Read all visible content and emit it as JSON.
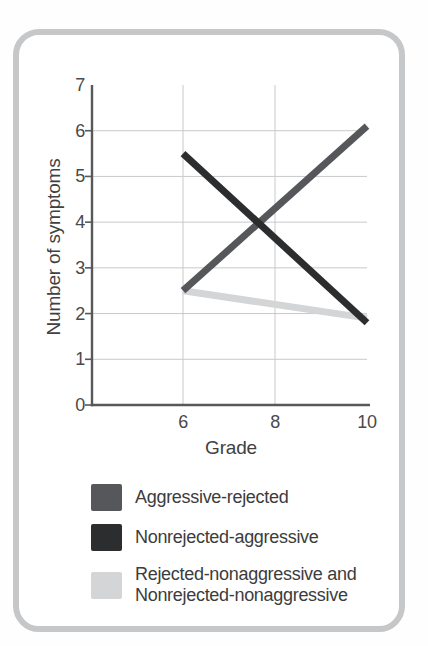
{
  "card": {
    "border_color": "#c6c7c8",
    "background": "#ffffff"
  },
  "chart_data": {
    "type": "line",
    "title": "",
    "xlabel": "Grade",
    "ylabel": "Number of symptoms",
    "xlim": [
      4,
      10
    ],
    "ylim": [
      0,
      7
    ],
    "xticks": [
      6,
      8,
      10
    ],
    "yticks": [
      0,
      1,
      2,
      3,
      4,
      5,
      6,
      7
    ],
    "grid": {
      "horizontal_at": [
        1,
        2,
        3,
        4,
        5,
        6
      ],
      "vertical_at": [
        6,
        8
      ]
    },
    "x": [
      6,
      10
    ],
    "series": [
      {
        "name": "Aggressive-rejected",
        "color": "#56575a",
        "values": [
          2.5,
          6.1
        ]
      },
      {
        "name": "Nonrejected-aggressive",
        "color": "#2c2d2f",
        "values": [
          5.5,
          1.8
        ]
      },
      {
        "name": "Rejected-nonaggressive and\nNonrejected-nonaggressive",
        "color": "#d4d5d6",
        "values": [
          2.5,
          1.9
        ]
      }
    ],
    "legend_position": "bottom",
    "line_width": 7,
    "axis_color": "#57585a",
    "gridline_color": "#c8c9ca"
  }
}
